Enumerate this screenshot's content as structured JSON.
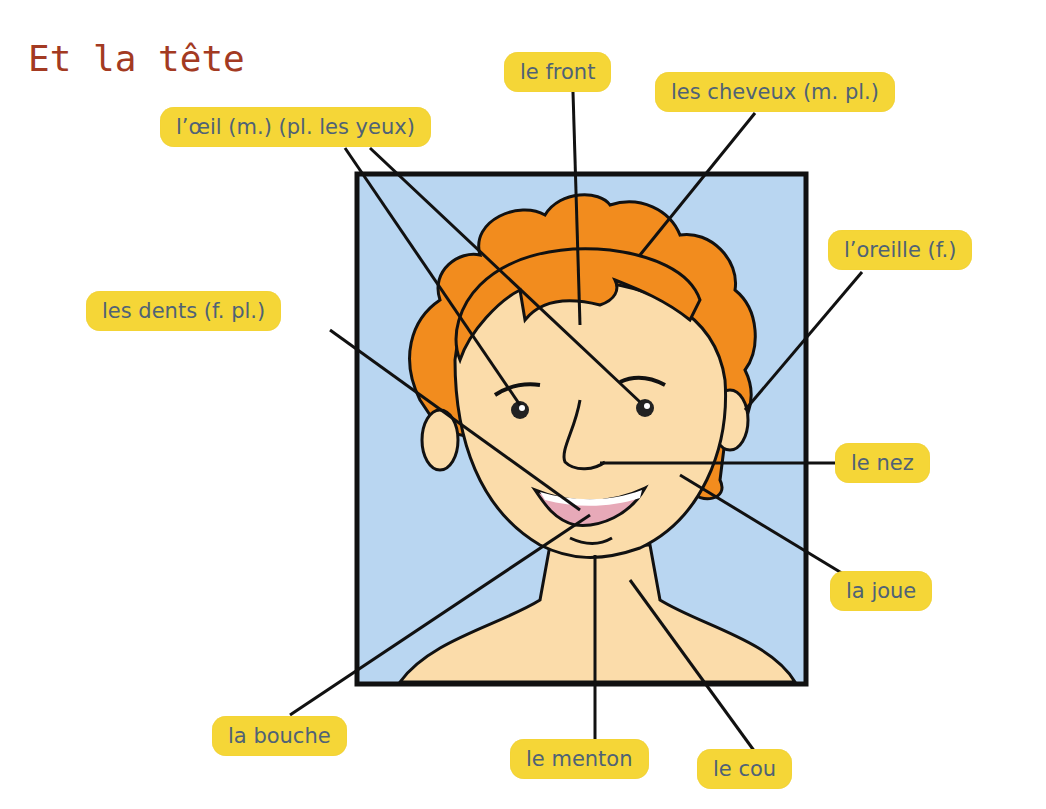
{
  "title": "Et la tête",
  "colors": {
    "title": "#a33a22",
    "label_bg": "#f5d637",
    "label_text": "#4f6276",
    "background_panel": "#b9d6f1",
    "hair": "#f28c1e",
    "skin": "#fbdcaa",
    "outline": "#111111"
  },
  "labels": {
    "front": "le front",
    "cheveux": "les cheveux (m. pl.)",
    "oeil": "l’œil (m.) (pl. les yeux)",
    "oreille": "l’oreille (f.)",
    "dents": "les dents (f. pl.)",
    "nez": "le nez",
    "joue": "la joue",
    "bouche": "la bouche",
    "menton": "le menton",
    "cou": "le cou"
  }
}
